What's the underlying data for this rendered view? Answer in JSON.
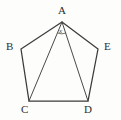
{
  "figure": {
    "type": "geometry-diagram",
    "shape_name": "pentagon",
    "background_color": "#fdfdfb",
    "stroke_color": "#3b3b3b",
    "vertices": [
      {
        "id": "A",
        "label": "A",
        "x": 62,
        "y": 22
      },
      {
        "id": "B",
        "label": "B",
        "x": 21,
        "y": 49
      },
      {
        "id": "C",
        "label": "C",
        "x": 29,
        "y": 101
      },
      {
        "id": "D",
        "label": "D",
        "x": 88,
        "y": 101
      },
      {
        "id": "E",
        "label": "E",
        "x": 98,
        "y": 49
      }
    ],
    "outline_points": "62,22 98,49 88,101 29,101 21,49",
    "diagonals": [
      {
        "id": "AC",
        "from": "A",
        "to": "C",
        "path": "M62,22 L29,101"
      },
      {
        "id": "AD",
        "from": "A",
        "to": "D",
        "path": "M62,22 L88,101"
      }
    ],
    "angle_marker": {
      "at_vertex": "A",
      "label": "x",
      "between": "AC and AD",
      "arc_path": "M57.5,33 A 12 12 0 0 0 66.2,33"
    }
  }
}
